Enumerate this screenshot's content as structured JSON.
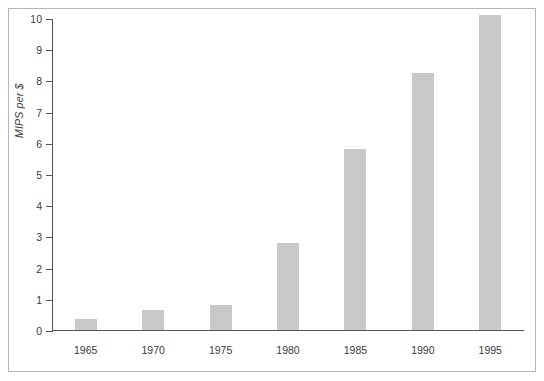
{
  "chart_data": {
    "type": "bar",
    "title": "",
    "xlabel": "",
    "ylabel": "MIPS per $",
    "categories": [
      "1965",
      "1970",
      "1975",
      "1980",
      "1985",
      "1990",
      "1995"
    ],
    "values": [
      0.35,
      0.65,
      0.8,
      2.8,
      5.8,
      8.25,
      10.1
    ],
    "ylim": [
      0,
      10
    ],
    "yticks": [
      0,
      1,
      2,
      3,
      4,
      5,
      6,
      7,
      8,
      9,
      10
    ],
    "ytick_labels": [
      "0",
      "1",
      "2",
      "3",
      "4",
      "5",
      "6",
      "7",
      "8",
      "9",
      "10"
    ],
    "grid": false,
    "legend": null,
    "bar_color": "#c9c9c9",
    "axis_color": "#555555",
    "frame_color": "#b6b6b6",
    "text_color": "#3a3a3a"
  }
}
